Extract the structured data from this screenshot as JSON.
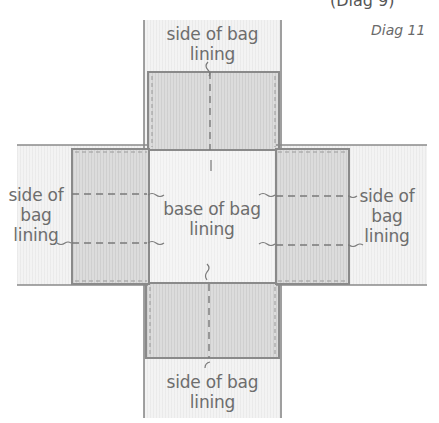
{
  "caption": "Diag 11",
  "top_cut_text": "(Diag 9)",
  "labels": {
    "top": [
      "side of bag",
      "lining"
    ],
    "bottom": [
      "side of bag",
      "lining"
    ],
    "left": [
      "side of",
      "bag",
      "lining"
    ],
    "right": [
      "side of",
      "bag",
      "lining"
    ],
    "center": [
      "base of bag",
      "lining"
    ]
  },
  "colors": {
    "fabric_light": "#f3f3f3",
    "fabric_grey": "#dcdcdc",
    "outline": "#8a8a8a",
    "text": "#6d6d6d"
  }
}
